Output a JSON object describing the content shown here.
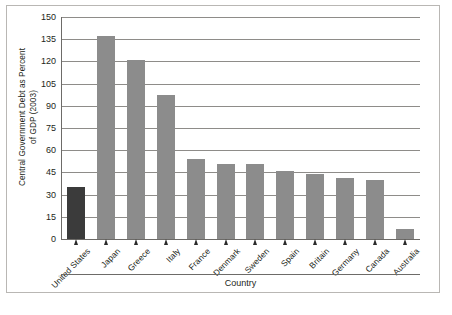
{
  "chart_data": {
    "type": "bar",
    "title": "",
    "xlabel": "Country",
    "ylabel": "Central Government Debt as Percent of GDP (2003)",
    "ylabel_line1": "Central Government Debt as Percent",
    "ylabel_line2": "of GDP (2003)",
    "categories": [
      "United States",
      "Japan",
      "Greece",
      "Italy",
      "France",
      "Denmark",
      "Sweden",
      "Spain",
      "Britain",
      "Germany",
      "Canada",
      "Australia"
    ],
    "values": [
      35,
      137,
      121,
      97,
      54,
      51,
      51,
      46,
      44,
      41,
      40,
      7
    ],
    "ylim": [
      0,
      150
    ],
    "yticks": [
      0,
      15,
      30,
      45,
      60,
      75,
      90,
      105,
      120,
      135,
      150
    ],
    "ytick_labels": [
      "0",
      "15",
      "30",
      "45",
      "60",
      "75",
      "90",
      "105",
      "120",
      "135",
      "150"
    ],
    "grid": true,
    "legend": "none",
    "highlight_index": 0,
    "colors": {
      "bar": "#8c8c8c",
      "bar_highlight": "#3b3b3b",
      "gridline": "#8e8c89",
      "axis": "#6d6b68",
      "text": "#231f20",
      "frame": "#b9b7b4",
      "background": "#ffffff"
    }
  }
}
